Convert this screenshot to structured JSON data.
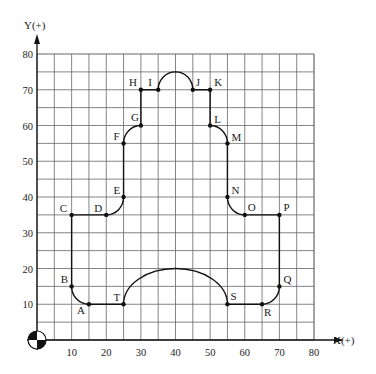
{
  "diagram": {
    "axes": {
      "x_label": "X(+)",
      "y_label": "Y(+)",
      "x_ticks": [
        "10",
        "20",
        "30",
        "40",
        "50",
        "60",
        "70",
        "80"
      ],
      "y_ticks": [
        "10",
        "20",
        "30",
        "40",
        "50",
        "60",
        "70",
        "80"
      ],
      "x_range": [
        0,
        80
      ],
      "y_range": [
        0,
        80
      ],
      "grid_step": 5
    },
    "origin_symbol": "work-zero-quadrant-icon",
    "points": [
      {
        "name": "A",
        "x": 15,
        "y": 10
      },
      {
        "name": "B",
        "x": 10,
        "y": 15
      },
      {
        "name": "C",
        "x": 10,
        "y": 35
      },
      {
        "name": "D",
        "x": 20,
        "y": 35
      },
      {
        "name": "E",
        "x": 25,
        "y": 40
      },
      {
        "name": "F",
        "x": 25,
        "y": 55
      },
      {
        "name": "G",
        "x": 30,
        "y": 60
      },
      {
        "name": "H",
        "x": 30,
        "y": 70
      },
      {
        "name": "I",
        "x": 35,
        "y": 70
      },
      {
        "name": "J",
        "x": 45,
        "y": 70
      },
      {
        "name": "K",
        "x": 50,
        "y": 70
      },
      {
        "name": "L",
        "x": 50,
        "y": 60
      },
      {
        "name": "M",
        "x": 55,
        "y": 55
      },
      {
        "name": "N",
        "x": 55,
        "y": 40
      },
      {
        "name": "O",
        "x": 60,
        "y": 35
      },
      {
        "name": "P",
        "x": 70,
        "y": 35
      },
      {
        "name": "Q",
        "x": 70,
        "y": 15
      },
      {
        "name": "R",
        "x": 65,
        "y": 10
      },
      {
        "name": "S",
        "x": 55,
        "y": 10
      },
      {
        "name": "T",
        "x": 25,
        "y": 10
      }
    ],
    "colors": {
      "grid": "#555555",
      "path": "#111111",
      "text": "#1a1a1a"
    }
  }
}
